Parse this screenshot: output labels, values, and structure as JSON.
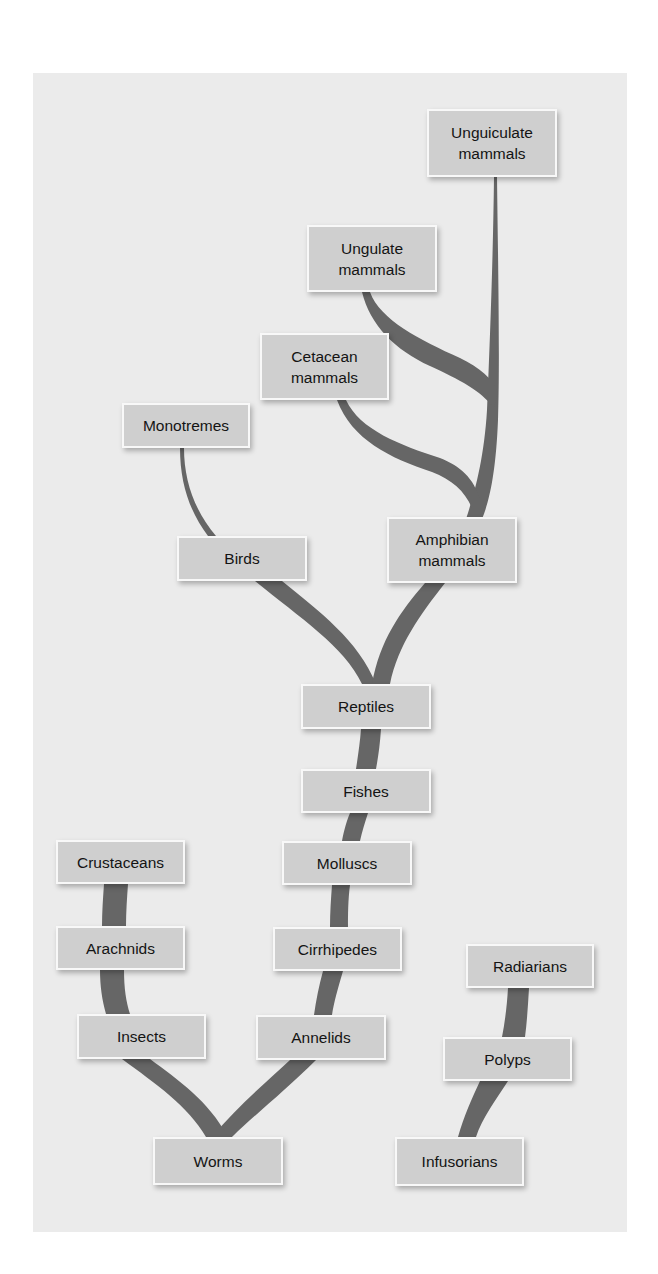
{
  "diagram": {
    "type": "evolutionary-tree",
    "colors": {
      "background": "#ffffff",
      "panel": "#ebebeb",
      "node_fill": "#cfcfcf",
      "node_border": "#f8f8f8",
      "branch": "#666666",
      "text": "#141414"
    },
    "nodes": {
      "unguiculate": "Unguiculate\nmammals",
      "ungulate": "Ungulate\nmammals",
      "cetacean": "Cetacean\nmammals",
      "monotremes": "Monotremes",
      "birds": "Birds",
      "amphibian": "Amphibian\nmammals",
      "reptiles": "Reptiles",
      "fishes": "Fishes",
      "molluscs": "Molluscs",
      "crustaceans": "Crustaceans",
      "arachnids": "Arachnids",
      "cirrhipedes": "Cirrhipedes",
      "radiarians": "Radiarians",
      "insects": "Insects",
      "annelids": "Annelids",
      "polyps": "Polyps",
      "worms": "Worms",
      "infusorians": "Infusorians"
    },
    "edges": [
      [
        "worms",
        "insects"
      ],
      [
        "worms",
        "annelids"
      ],
      [
        "insects",
        "arachnids"
      ],
      [
        "arachnids",
        "crustaceans"
      ],
      [
        "annelids",
        "cirrhipedes"
      ],
      [
        "cirrhipedes",
        "molluscs"
      ],
      [
        "molluscs",
        "fishes"
      ],
      [
        "fishes",
        "reptiles"
      ],
      [
        "reptiles",
        "birds"
      ],
      [
        "reptiles",
        "amphibian"
      ],
      [
        "birds",
        "monotremes"
      ],
      [
        "amphibian",
        "cetacean"
      ],
      [
        "amphibian",
        "ungulate"
      ],
      [
        "amphibian",
        "unguiculate"
      ],
      [
        "infusorians",
        "polyps"
      ],
      [
        "polyps",
        "radiarians"
      ]
    ]
  }
}
